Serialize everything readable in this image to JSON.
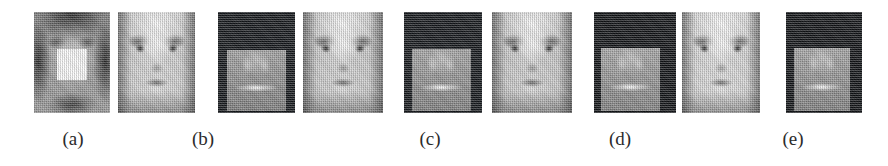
{
  "figure": {
    "kind": "image-panel-row",
    "background_color": "#ffffff",
    "panel_count": 9,
    "caption_count": 5,
    "captions": [
      {
        "label": "(a)",
        "center_x": 73,
        "y": 129
      },
      {
        "label": "(b)",
        "center_x": 203,
        "y": 129
      },
      {
        "label": "(c)",
        "center_x": 430,
        "y": 129
      },
      {
        "label": "(d)",
        "center_x": 620,
        "y": 129
      },
      {
        "label": "(e)",
        "center_x": 793,
        "y": 129
      }
    ],
    "panels": [
      {
        "id": "panel-1",
        "name": "occluded-input-face",
        "group": "a",
        "description": "grayscale frontal face with bright white rectangular occlusion patch over nose and mouth",
        "x": 34,
        "y": 12,
        "width": 76,
        "height": 101,
        "tone": "mid-gray",
        "base_color": "#9b9b9b",
        "has_occlusion_patch": true,
        "occlusion": {
          "x": 0.3,
          "y": 0.37,
          "width": 0.4,
          "height": 0.3,
          "color": "#fdfdfd"
        }
      },
      {
        "id": "panel-2",
        "name": "reconstructed-face-b",
        "group": "b",
        "description": "bright grayscale frontal face, fully reconstructed, no occlusion",
        "x": 118,
        "y": 12,
        "width": 77,
        "height": 101,
        "tone": "light-gray",
        "base_color": "#cfcfcf",
        "has_occlusion_patch": false,
        "occlusion": null
      },
      {
        "id": "panel-3",
        "name": "residual-error-map-c",
        "group": "c",
        "description": "dark residual/error map with bright eye specular points and lighter square region with bright horizontal mouth band",
        "x": 218,
        "y": 12,
        "width": 77,
        "height": 101,
        "tone": "dark",
        "base_color": "#15181c",
        "has_occlusion_patch": true,
        "occlusion": {
          "x": 0.12,
          "y": 0.38,
          "width": 0.76,
          "height": 0.6,
          "color": "#9a9a9a"
        }
      },
      {
        "id": "panel-4",
        "name": "reconstructed-face-c",
        "group": "c",
        "description": "bright grayscale frontal face reconstruction paired with the c residual map",
        "x": 303,
        "y": 12,
        "width": 80,
        "height": 101,
        "tone": "light-gray",
        "base_color": "#cacaca",
        "has_occlusion_patch": false,
        "occlusion": null
      },
      {
        "id": "panel-5",
        "name": "residual-error-map-d",
        "group": "d",
        "description": "dark residual/error map with bright eye points and lighter square region with bright mouth band",
        "x": 404,
        "y": 12,
        "width": 78,
        "height": 101,
        "tone": "dark",
        "base_color": "#15181c",
        "has_occlusion_patch": true,
        "occlusion": {
          "x": 0.1,
          "y": 0.37,
          "width": 0.76,
          "height": 0.61,
          "color": "#9d9d9d"
        }
      },
      {
        "id": "panel-6",
        "name": "reconstructed-face-d",
        "group": "d",
        "description": "bright grayscale frontal face reconstruction paired with the d residual map",
        "x": 492,
        "y": 12,
        "width": 80,
        "height": 101,
        "tone": "light-gray",
        "base_color": "#c8c8c8",
        "has_occlusion_patch": false,
        "occlusion": null
      },
      {
        "id": "panel-7",
        "name": "residual-error-map-e1",
        "group": "e",
        "description": "dark residual/error map with bright eye point and lighter square region with bright mouth band",
        "x": 594,
        "y": 12,
        "width": 82,
        "height": 101,
        "tone": "dark",
        "base_color": "#121417",
        "has_occlusion_patch": true,
        "occlusion": {
          "x": 0.08,
          "y": 0.36,
          "width": 0.72,
          "height": 0.62,
          "color": "#a0a0a0"
        }
      },
      {
        "id": "panel-8",
        "name": "reconstructed-face-e",
        "group": "e",
        "description": "bright grayscale frontal face reconstruction, strongest highlights on forehead and cheeks",
        "x": 682,
        "y": 12,
        "width": 78,
        "height": 101,
        "tone": "very-light-gray",
        "base_color": "#d6d6d6",
        "has_occlusion_patch": false,
        "occlusion": null
      },
      {
        "id": "panel-9",
        "name": "residual-error-map-e2",
        "group": "e",
        "description": "dark residual/error map at far right with bright eye point and lighter square region with bright mouth band",
        "x": 786,
        "y": 12,
        "width": 76,
        "height": 101,
        "tone": "dark",
        "base_color": "#121417",
        "has_occlusion_patch": true,
        "occlusion": {
          "x": 0.1,
          "y": 0.36,
          "width": 0.74,
          "height": 0.62,
          "color": "#9e9e9e"
        }
      }
    ]
  }
}
